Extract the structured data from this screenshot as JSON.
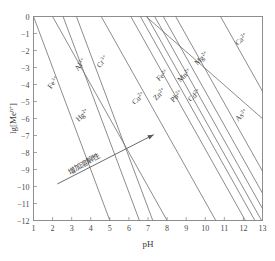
{
  "chart_data": {
    "type": "line",
    "title": "",
    "xlabel": "pH",
    "ylabel": "lg[Meⁿ⁺]",
    "ylabel_base": "lg[Me",
    "ylabel_sup": "n+",
    "ylabel_tail": "]",
    "xlim": [
      1,
      13
    ],
    "ylim": [
      -12,
      0
    ],
    "xticks": [
      1,
      2,
      3,
      4,
      5,
      6,
      7,
      8,
      9,
      10,
      11,
      12,
      13
    ],
    "yticks": [
      0,
      -1,
      -2,
      -3,
      -4,
      -5,
      -6,
      -7,
      -8,
      -9,
      -10,
      -11,
      -12
    ],
    "xtick_labels": [
      "1",
      "2",
      "3",
      "4",
      "5",
      "6",
      "7",
      "8",
      "9",
      "10",
      "11",
      "12",
      "13"
    ],
    "ytick_labels": [
      "0",
      "−1",
      "−2",
      "−3",
      "−4",
      "−5",
      "−6",
      "−7",
      "−8",
      "−9",
      "−10",
      "−11",
      "−12"
    ],
    "grid": false,
    "legend": "inline-labels",
    "line_color": "#6f6f6f",
    "frame_color": "#8e8e8e",
    "series": [
      {
        "name": "Fe3+",
        "element": "Fe",
        "charge": "3+",
        "x": [
          1.0,
          5.0
        ],
        "y": [
          0.0,
          -12.0
        ],
        "label_x": 55,
        "label_y": 84,
        "label_rot": -52
      },
      {
        "name": "Al3+",
        "element": "Al",
        "charge": "3+",
        "x": [
          2.55,
          6.55
        ],
        "y": [
          0.0,
          -12.0
        ],
        "label_x": 82,
        "label_y": 66,
        "label_rot": -52
      },
      {
        "name": "Cr3+",
        "element": "Cr",
        "charge": "3+",
        "x": [
          3.25,
          7.25
        ],
        "y": [
          0.0,
          -12.0
        ],
        "label_x": 104,
        "label_y": 63,
        "label_rot": -52
      },
      {
        "name": "Hg2+",
        "element": "Hg",
        "charge": "2+",
        "x": [
          2.0,
          8.0
        ],
        "y": [
          0.0,
          -12.0
        ],
        "label_x": 84,
        "label_y": 117,
        "label_rot": -44
      },
      {
        "name": "Cu2+",
        "element": "Cu",
        "charge": "2+",
        "x": [
          4.55,
          10.55
        ],
        "y": [
          0.0,
          -12.0
        ],
        "label_x": 140,
        "label_y": 100,
        "label_rot": -44
      },
      {
        "name": "Zn2+",
        "element": "Zn",
        "charge": "2+",
        "x": [
          6.1,
          12.1
        ],
        "y": [
          0.0,
          -12.0
        ],
        "label_x": 161,
        "label_y": 96,
        "label_rot": -44
      },
      {
        "name": "Fe2+",
        "element": "Fe",
        "charge": "2+",
        "x": [
          6.6,
          12.6
        ],
        "y": [
          0.0,
          -12.0
        ],
        "label_x": 164,
        "label_y": 77,
        "label_rot": -44
      },
      {
        "name": "Pb2+",
        "element": "Pb",
        "charge": "2+",
        "x": [
          6.95,
          12.95
        ],
        "y": [
          0.0,
          -12.0
        ],
        "label_x": 178,
        "label_y": 98,
        "label_rot": -44
      },
      {
        "name": "Mn2+",
        "element": "Mn",
        "charge": "2+",
        "x": [
          7.35,
          13.35
        ],
        "y": [
          0.0,
          -12.0
        ],
        "label_x": 186,
        "label_y": 77,
        "label_rot": -44
      },
      {
        "name": "Cd2+",
        "element": "Cd",
        "charge": "2+",
        "x": [
          7.8,
          13.8
        ],
        "y": [
          0.0,
          -12.0
        ],
        "label_x": 196,
        "label_y": 97,
        "label_rot": -44
      },
      {
        "name": "Mg2+",
        "element": "Mg",
        "charge": "2+",
        "x": [
          8.45,
          14.45
        ],
        "y": [
          0.0,
          -12.0
        ],
        "label_x": 203,
        "label_y": 60,
        "label_rot": -44
      },
      {
        "name": "Ca2+",
        "element": "Ca",
        "charge": "2+",
        "x": [
          10.8,
          16.8
        ],
        "y": [
          0.0,
          -12.0
        ],
        "label_x": 243,
        "label_y": 41,
        "label_rot": -44
      },
      {
        "name": "As3+",
        "element": "As",
        "charge": "3+",
        "x": [
          6.9,
          13.6
        ],
        "y": [
          0.0,
          -6.6
        ],
        "label_x": 243,
        "label_y": 117,
        "label_rot": -44
      }
    ],
    "annotations": [
      {
        "text": "增加溶解性",
        "name": "solubility-trend-annotation",
        "arrow_from_x": 2.25,
        "arrow_from_y": -9.85,
        "arrow_to_x": 7.3,
        "arrow_to_y": -6.95,
        "text_x": 85,
        "text_y": 166,
        "text_rot": -30
      }
    ]
  }
}
